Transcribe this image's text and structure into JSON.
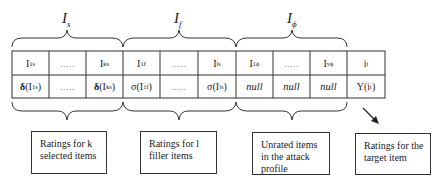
{
  "set_labels": {
    "selected": {
      "base": "I",
      "sub": "s"
    },
    "filler": {
      "base": "I",
      "sub": "f"
    },
    "unrated": {
      "base": "I",
      "sub": "ϕ"
    }
  },
  "table": {
    "header_row": [
      {
        "base": "I",
        "sub": "1",
        "sup": "s"
      },
      {
        "dots": "....."
      },
      {
        "base": "I",
        "sub": "k",
        "sup": "s"
      },
      {
        "base": "I",
        "sub": "1",
        "sup": "f"
      },
      {
        "dots": "....."
      },
      {
        "base": "I",
        "sub": "l",
        "sup": "s"
      },
      {
        "base": "I",
        "sub": "1",
        "sup": "ϕ"
      },
      {
        "dots": "....."
      },
      {
        "base": "I",
        "sub": "v",
        "sup": "ϕ"
      },
      {
        "base": "i",
        "sub": "t"
      }
    ],
    "value_row": [
      {
        "fn": "δ",
        "arg": "I",
        "sub": "1",
        "sup": "s"
      },
      {
        "dots": "....."
      },
      {
        "fn": "δ",
        "arg": "I",
        "sub": "k",
        "sup": "s"
      },
      {
        "fn": "σ",
        "arg": "I",
        "sub": "1",
        "sup": "f"
      },
      {
        "dots": "....."
      },
      {
        "fn": "σ",
        "arg": "I",
        "sub": "l",
        "sup": "s"
      },
      {
        "null": "null"
      },
      {
        "null": "null"
      },
      {
        "null": "null"
      },
      {
        "fn": "Υ",
        "arg": "i",
        "sub": "t"
      }
    ]
  },
  "notes": {
    "selected": "Ratings for k selected items",
    "filler": "Ratings for l filler items",
    "unrated": "Unrated items in the attack profile",
    "target": "Ratings for the target item"
  },
  "colors": {
    "line": "#333333",
    "text": "#1a1a1a",
    "dots": "#888888"
  }
}
